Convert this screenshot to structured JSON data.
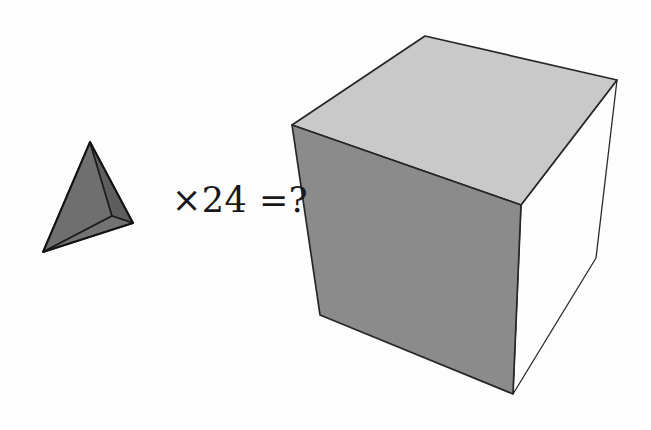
{
  "figure": {
    "kind": "geometry-illustration",
    "caption_text": "×24 =?",
    "background_color": "#fdfdfd",
    "equation": {
      "multiplier_symbol": "×",
      "multiplier_value": "24",
      "equals_symbol": "=",
      "result": "?",
      "full_text": "×24 =?",
      "text_color": "#18181a"
    },
    "shapes": [
      {
        "id": "tetrahedron",
        "name": "tetrahedron",
        "label": "tetrahedron",
        "outline_color": "#1c1c1c",
        "faces": [
          {
            "name": "tetra-face-left",
            "fill": "#6f6f6f",
            "points": "90,142 112,216 43,252"
          },
          {
            "name": "tetra-face-right",
            "fill": "#5e5e5e",
            "points": "90,142 133,223 112,216"
          },
          {
            "name": "tetra-face-bottom",
            "fill": "#737373",
            "points": "112,216 133,223 43,252"
          }
        ]
      },
      {
        "id": "cube",
        "name": "cube",
        "label": "cube",
        "outline_color": "#1c1c1c",
        "faces": [
          {
            "name": "cube-face-top",
            "fill": "#c9c9c9",
            "points": "292,125 425,36 617,80 521,205"
          },
          {
            "name": "cube-face-front",
            "fill": "#8b8b8b",
            "points": "292,125 521,205 513,394 320,315"
          },
          {
            "name": "cube-face-right",
            "fill": "#fefefe",
            "points": "521,205 617,80 596,258 513,394"
          }
        ]
      }
    ]
  }
}
